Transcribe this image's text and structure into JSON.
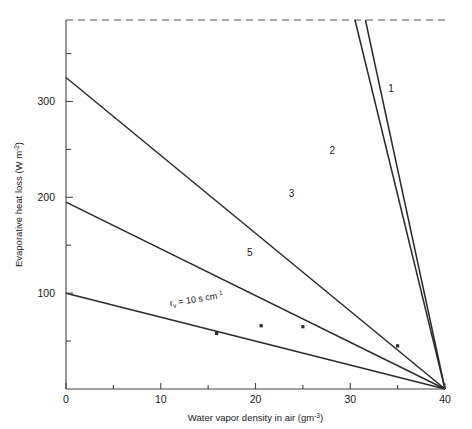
{
  "chart_data": {
    "type": "line",
    "title": "",
    "xlabel": "Water vapor density in air (gm",
    "xlabel_sup": "-3",
    "xlabel_tail": ")",
    "ylabel": "Evaporative heat loss (W m",
    "ylabel_sup": "-2",
    "ylabel_tail": ")",
    "xlim": [
      0,
      40
    ],
    "ylim": [
      0,
      385
    ],
    "xticks": [
      0,
      10,
      20,
      30,
      40
    ],
    "xticklabels": [
      "0",
      "10",
      "20",
      "30",
      "40"
    ],
    "xminorticks": [
      5,
      15,
      25,
      35
    ],
    "yticks": [
      100,
      200,
      300
    ],
    "yticklabels": [
      "100",
      "200",
      "300"
    ],
    "yminorticks": [
      50,
      150,
      250,
      350
    ],
    "grid": false,
    "legend": "none",
    "convergence_point": [
      40,
      0
    ],
    "top_dashed_line_value": 385,
    "series": [
      {
        "name": "1",
        "label": "1",
        "resistance_s_per_cm": 1,
        "y_intercept": 3250,
        "x_start": 31.6,
        "y_start": 385,
        "x_end": 40,
        "y_end": 0,
        "label_x": 34.3,
        "label_y": 310
      },
      {
        "name": "2",
        "label": "2",
        "resistance_s_per_cm": 2,
        "y_intercept": 1625,
        "x_start": 30.5,
        "y_start": 385,
        "x_end": 40,
        "y_end": 0,
        "label_x": 28.1,
        "label_y": 245
      },
      {
        "name": "3",
        "label": "3",
        "resistance_s_per_cm": 3,
        "y_intercept": 325,
        "x_start": 0,
        "y_start": 325,
        "x_end": 40,
        "y_end": 0,
        "label_x": 23.8,
        "label_y": 200
      },
      {
        "name": "5",
        "label": "5",
        "resistance_s_per_cm": 5,
        "y_intercept": 195,
        "x_start": 0,
        "y_start": 195,
        "x_end": 40,
        "y_end": 0,
        "label_x": 19.4,
        "label_y": 139
      },
      {
        "name": "10",
        "label": "",
        "resistance_s_per_cm": 10,
        "y_intercept": 100,
        "x_start": 0,
        "y_start": 100,
        "x_end": 40,
        "y_end": 0,
        "label_x": 0,
        "label_y": 0
      }
    ],
    "annotations": [
      {
        "name": "rv-annotation",
        "text_main": "r",
        "text_sub": "v",
        "text_rest": " = 10 s cm",
        "text_sup": "-1",
        "x": 11.0,
        "y": 86,
        "rotation": -9.5
      }
    ],
    "markers": [
      {
        "name": "data-point-1",
        "x": 20.6,
        "y": 66
      },
      {
        "name": "data-point-2",
        "x": 25.0,
        "y": 65
      },
      {
        "name": "data-point-3",
        "x": 35.0,
        "y": 45
      },
      {
        "name": "data-point-4",
        "x": 15.9,
        "y": 58
      }
    ]
  }
}
